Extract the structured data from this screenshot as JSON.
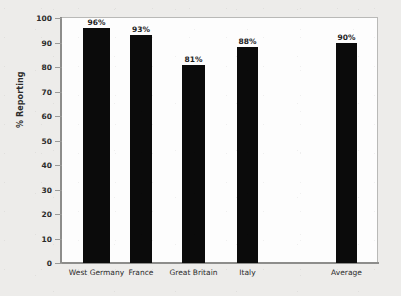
{
  "chart_data": {
    "type": "bar",
    "title": "",
    "subtitle": "",
    "xlabel": "",
    "ylabel": "% Reporting",
    "ylim": [
      0,
      100
    ],
    "grid": false,
    "legend": null,
    "categories": [
      "West Germany",
      "France",
      "Great Britain",
      "Italy",
      "Average"
    ],
    "values": [
      96,
      93,
      81,
      88,
      90
    ],
    "data_labels": [
      "96%",
      "93%",
      "81%",
      "88%",
      "90%"
    ],
    "ytick_labels": [
      "100",
      "90",
      "80",
      "70",
      "60",
      "50",
      "40",
      "30",
      "20",
      "10",
      "0"
    ],
    "ytick_values": [
      100,
      90,
      80,
      70,
      60,
      50,
      40,
      30,
      20,
      10,
      0
    ],
    "bar_color": "#0b0b0b",
    "plot_background": "#fdfdfd",
    "figure_background": "#edecea",
    "axis_color": "#8d8d8b"
  }
}
